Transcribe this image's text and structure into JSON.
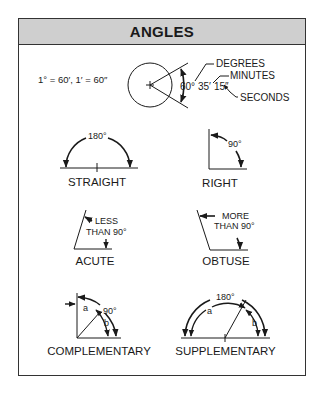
{
  "header": {
    "title": "ANGLES"
  },
  "conversion": {
    "formula": "1° = 60′, 1′ = 60″",
    "example_value": "60°35′15″",
    "degrees_part": "60°",
    "minutes_part": "35′",
    "seconds_part": "15″",
    "callouts": {
      "degrees": "DEGREES",
      "minutes": "MINUTES",
      "seconds": "SECONDS"
    }
  },
  "angles": [
    {
      "id": "straight",
      "label": "STRAIGHT",
      "annotation": "180°"
    },
    {
      "id": "right",
      "label": "RIGHT",
      "annotation": "90°"
    },
    {
      "id": "acute",
      "label": "ACUTE",
      "annotation_line1": "LESS",
      "annotation_line2": "THAN 90°"
    },
    {
      "id": "obtuse",
      "label": "OBTUSE",
      "annotation_line1": "MORE",
      "annotation_line2": "THAN 90°"
    },
    {
      "id": "complementary",
      "label": "COMPLEMENTARY",
      "annotation": "90°",
      "part_a": "a",
      "part_b": "b"
    },
    {
      "id": "supplementary",
      "label": "SUPPLEMENTARY",
      "annotation": "180°",
      "part_a": "a",
      "part_b": "b"
    }
  ],
  "colors": {
    "header_bg": "#cfcfcf",
    "line": "#1a1a1a",
    "border": "#333333"
  }
}
